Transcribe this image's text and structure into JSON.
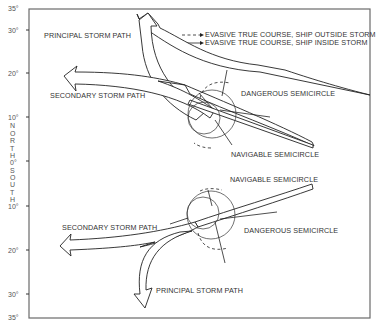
{
  "axis": {
    "ticks": [
      {
        "label": "35°",
        "lat": 35,
        "hemisphere": "north"
      },
      {
        "label": "30°",
        "lat": 30,
        "hemisphere": "north"
      },
      {
        "label": "20°",
        "lat": 20,
        "hemisphere": "north"
      },
      {
        "label": "10°",
        "lat": 10,
        "hemisphere": "north"
      },
      {
        "label": "0°",
        "lat": 0,
        "hemisphere": "equator"
      },
      {
        "label": "10°",
        "lat": 10,
        "hemisphere": "south"
      },
      {
        "label": "20°",
        "lat": 20,
        "hemisphere": "south"
      },
      {
        "label": "30°",
        "lat": 30,
        "hemisphere": "south"
      },
      {
        "label": "35°",
        "lat": 35,
        "hemisphere": "south"
      }
    ],
    "north_letters": [
      "N",
      "O",
      "R",
      "T",
      "H"
    ],
    "south_letters": [
      "S",
      "O",
      "U",
      "T",
      "H"
    ]
  },
  "legend": {
    "dashed": "EVASIVE TRUE COURSE, SHIP OUTSIDE STORM",
    "solid": "EVASIVE TRUE COURSE, SHIP INSIDE STORM"
  },
  "north": {
    "principal": "PRINCIPAL STORM PATH",
    "secondary": "SECONDARY STORM PATH",
    "dangerous": "DANGEROUS SEMICIRCLE",
    "navigable": "NAVIGABLE SEMICIRCLE"
  },
  "south": {
    "principal": "PRINCIPAL STORM PATH",
    "secondary": "SECONDARY STORM PATH",
    "dangerous": "DANGEROUS SEMICIRCLE",
    "navigable": "NAVIGABLE SEMICIRCLE"
  }
}
